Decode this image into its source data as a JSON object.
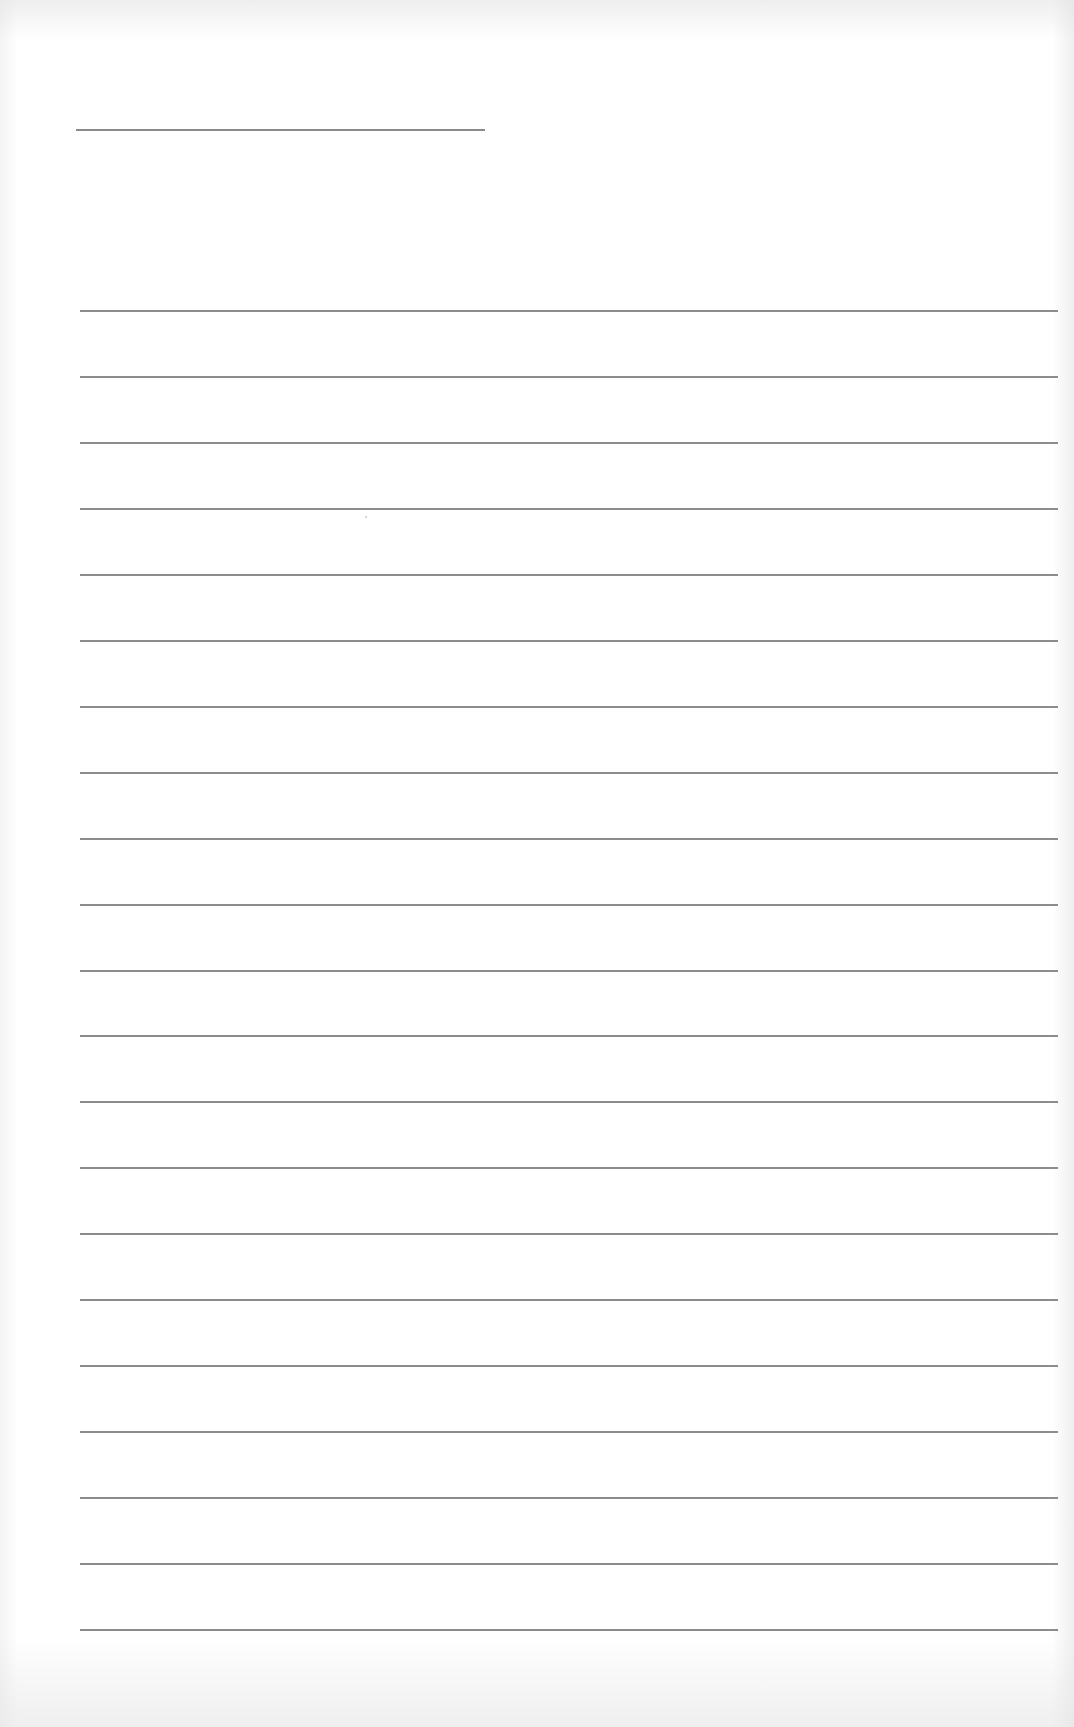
{
  "document": {
    "type": "lined-paper",
    "title_line": {
      "x": 76,
      "y": 129,
      "width": 409
    },
    "rules": {
      "count": 21,
      "first_y": 310,
      "spacing": 65.95,
      "x": 80,
      "width": 978,
      "color": "#8c8c8c"
    },
    "text": ""
  }
}
